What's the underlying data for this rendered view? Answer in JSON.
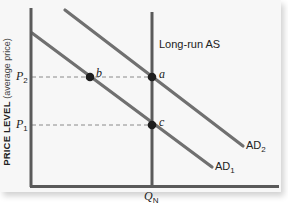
{
  "figure": {
    "y_axis_label": "PRICE LEVEL",
    "y_axis_sublabel": "(average price)",
    "x_tick_label": {
      "base": "Q",
      "sub": "N"
    },
    "y_ticks": [
      {
        "base": "P",
        "sub": "2"
      },
      {
        "base": "P",
        "sub": "1"
      }
    ],
    "curves": {
      "lras_label": "Long-run AS",
      "ad1": {
        "base": "AD",
        "sub": "1"
      },
      "ad2": {
        "base": "AD",
        "sub": "2"
      }
    },
    "points": {
      "a": "a",
      "b": "b",
      "c": "c"
    },
    "colors": {
      "curve": "#707070",
      "axis": "#5a5a5a",
      "point": "#1e1e1e",
      "guide": "#8a8a8a",
      "panel": "#f7f7f7"
    }
  }
}
